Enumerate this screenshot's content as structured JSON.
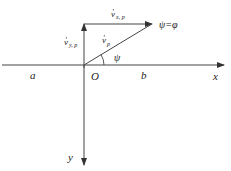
{
  "diagram": {
    "type": "velocity-vector-diagram",
    "axes": {
      "x_label": "x",
      "y_label": "y",
      "origin_label": "O",
      "left_label": "a",
      "right_label": "b"
    },
    "vectors": {
      "vx": {
        "base": "v",
        "sub": "x, p"
      },
      "vy": {
        "base": "v",
        "sub": "y, p"
      },
      "v": {
        "base": "v",
        "sub": "p"
      }
    },
    "angle_label": "ψ",
    "equation_label": "ψ=φ",
    "colors": {
      "line": "#333333",
      "background": "#ffffff"
    }
  }
}
